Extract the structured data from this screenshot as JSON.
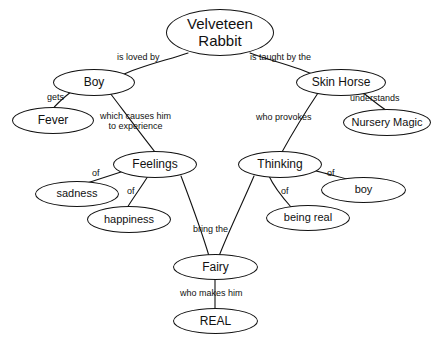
{
  "map": {
    "title": "Velveteen Rabbit",
    "background_color": "#ffffff",
    "line_color": "#121212",
    "text_color": "#111111",
    "nodes": [
      {
        "id": "velveteen_rabbit",
        "label": "Velveteen\nRabbit",
        "x": 166,
        "y": 9,
        "w": 108,
        "h": 47,
        "font_size": 15
      },
      {
        "id": "boy_top",
        "label": "Boy",
        "x": 53,
        "y": 69,
        "w": 82,
        "h": 27,
        "font_size": 12
      },
      {
        "id": "skin_horse",
        "label": "Skin Horse",
        "x": 296,
        "y": 69,
        "w": 90,
        "h": 27,
        "font_size": 12
      },
      {
        "id": "fever",
        "label": "Fever",
        "x": 12,
        "y": 107,
        "w": 82,
        "h": 27,
        "font_size": 12
      },
      {
        "id": "nursery_magic",
        "label": "Nursery Magic",
        "x": 343,
        "y": 109,
        "w": 88,
        "h": 27,
        "font_size": 11
      },
      {
        "id": "feelings",
        "label": "Feelings",
        "x": 113,
        "y": 151,
        "w": 84,
        "h": 27,
        "font_size": 12
      },
      {
        "id": "thinking",
        "label": "Thinking",
        "x": 238,
        "y": 151,
        "w": 84,
        "h": 27,
        "font_size": 12
      },
      {
        "id": "sadness",
        "label": "sadness",
        "x": 35,
        "y": 181,
        "w": 84,
        "h": 26,
        "font_size": 11
      },
      {
        "id": "boy_lower",
        "label": "boy",
        "x": 321,
        "y": 177,
        "w": 85,
        "h": 26,
        "font_size": 11
      },
      {
        "id": "happiness",
        "label": "happiness",
        "x": 87,
        "y": 206,
        "w": 84,
        "h": 27,
        "font_size": 11
      },
      {
        "id": "being_real",
        "label": "being real",
        "x": 266,
        "y": 205,
        "w": 84,
        "h": 26,
        "font_size": 11
      },
      {
        "id": "fairy",
        "label": "Fairy",
        "x": 173,
        "y": 254,
        "w": 85,
        "h": 26,
        "font_size": 12
      },
      {
        "id": "real",
        "label": "REAL",
        "x": 173,
        "y": 308,
        "w": 85,
        "h": 26,
        "font_size": 12
      }
    ],
    "edges": [
      {
        "id": "e_rabbit_boy",
        "from": "velveteen_rabbit",
        "to": "boy_top",
        "label": "is loved by",
        "label_x": 117,
        "label_y": 52,
        "font_size": 9,
        "points": [
          [
            188,
            53
          ],
          [
            168,
            60
          ],
          [
            140,
            66
          ],
          [
            120,
            76
          ]
        ]
      },
      {
        "id": "e_rabbit_skinhorse",
        "from": "velveteen_rabbit",
        "to": "skin_horse",
        "label": "is taught by the",
        "label_x": 250,
        "label_y": 52,
        "font_size": 9,
        "points": [
          [
            250,
            53
          ],
          [
            268,
            60
          ],
          [
            296,
            66
          ],
          [
            317,
            76
          ]
        ]
      },
      {
        "id": "e_boy_fever",
        "from": "boy_top",
        "to": "fever",
        "label": "gets",
        "label_x": 47,
        "label_y": 92,
        "font_size": 9,
        "points": [
          [
            72,
            91
          ],
          [
            62,
            99
          ],
          [
            56,
            104
          ],
          [
            52,
            110
          ]
        ]
      },
      {
        "id": "e_boy_feelings",
        "from": "boy_top",
        "to": "feelings",
        "label": "which causes him\nto experience",
        "label_x": 100,
        "label_y": 111,
        "font_size": 9,
        "points": [
          [
            110,
            93
          ],
          [
            120,
            106
          ],
          [
            140,
            133
          ],
          [
            155,
            152
          ]
        ]
      },
      {
        "id": "e_skinhorse_nursery",
        "from": "skin_horse",
        "to": "nursery_magic",
        "label": "understands",
        "label_x": 350,
        "label_y": 93,
        "font_size": 9,
        "points": [
          [
            361,
            91
          ],
          [
            372,
            100
          ],
          [
            382,
            108
          ],
          [
            389,
            112
          ]
        ]
      },
      {
        "id": "e_skinhorse_thinking",
        "from": "skin_horse",
        "to": "thinking",
        "label": "who provokes",
        "label_x": 256,
        "label_y": 112,
        "font_size": 9,
        "points": [
          [
            318,
            93
          ],
          [
            308,
            108
          ],
          [
            293,
            132
          ],
          [
            282,
            152
          ]
        ]
      },
      {
        "id": "e_feelings_sadness",
        "from": "feelings",
        "to": "sadness",
        "label": "of",
        "label_x": 92,
        "label_y": 168,
        "font_size": 9,
        "points": [
          [
            124,
            171
          ],
          [
            112,
            175
          ],
          [
            96,
            180
          ],
          [
            84,
            184
          ]
        ]
      },
      {
        "id": "e_feelings_happiness",
        "from": "feelings",
        "to": "happiness",
        "label": "of",
        "label_x": 127,
        "label_y": 186,
        "font_size": 9,
        "points": [
          [
            148,
            176
          ],
          [
            142,
            186
          ],
          [
            133,
            198
          ],
          [
            127,
            208
          ]
        ]
      },
      {
        "id": "e_thinking_boy",
        "from": "thinking",
        "to": "boy_lower",
        "label": "of",
        "label_x": 327,
        "label_y": 168,
        "font_size": 9,
        "points": [
          [
            313,
            170
          ],
          [
            327,
            174
          ],
          [
            344,
            178
          ],
          [
            358,
            182
          ]
        ]
      },
      {
        "id": "e_thinking_beingreal",
        "from": "thinking",
        "to": "being_real",
        "label": "of",
        "label_x": 281,
        "label_y": 186,
        "font_size": 9,
        "points": [
          [
            269,
            176
          ],
          [
            274,
            187
          ],
          [
            283,
            198
          ],
          [
            291,
            207
          ]
        ]
      },
      {
        "id": "e_feelings_fairy",
        "from": "feelings",
        "to": "fairy",
        "label": "bring the",
        "label_x": 193,
        "label_y": 224,
        "font_size": 9,
        "points": [
          [
            181,
            176
          ],
          [
            190,
            200
          ],
          [
            200,
            226
          ],
          [
            209,
            256
          ]
        ]
      },
      {
        "id": "e_thinking_fairy",
        "from": "thinking",
        "to": "fairy",
        "label": "",
        "label_x": 0,
        "label_y": 0,
        "font_size": 9,
        "points": [
          [
            254,
            176
          ],
          [
            243,
            202
          ],
          [
            230,
            228
          ],
          [
            219,
            256
          ]
        ]
      },
      {
        "id": "e_fairy_real",
        "from": "fairy",
        "to": "real",
        "label": "who makes him",
        "label_x": 180,
        "label_y": 288,
        "font_size": 9,
        "points": [
          [
            215,
            279
          ],
          [
            215,
            290
          ],
          [
            215,
            300
          ],
          [
            215,
            309
          ]
        ]
      }
    ]
  }
}
